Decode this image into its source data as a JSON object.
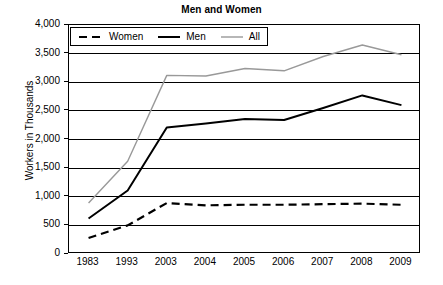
{
  "chart_data": {
    "type": "line",
    "title": "Men and Women",
    "xlabel": "",
    "ylabel": "Workers in Thousands",
    "categories": [
      "1983",
      "1993",
      "2003",
      "2004",
      "2005",
      "2006",
      "2007",
      "2008",
      "2009"
    ],
    "ylim": [
      0,
      4000
    ],
    "ytick_labels": [
      "4,000",
      "3,500",
      "3,000",
      "2,500",
      "2,000",
      "1,500",
      "1,000",
      "500",
      "0"
    ],
    "ytick_values": [
      4000,
      3500,
      3000,
      2500,
      2000,
      1500,
      1000,
      500,
      0
    ],
    "grid": true,
    "legend_position": "top-left",
    "series": [
      {
        "name": "Women",
        "style": "dashed",
        "color": "#000000",
        "values": [
          280,
          500,
          890,
          850,
          860,
          860,
          870,
          880,
          860
        ]
      },
      {
        "name": "Men",
        "style": "solid",
        "color": "#000000",
        "values": [
          620,
          1110,
          2210,
          2280,
          2360,
          2340,
          2550,
          2770,
          2600
        ]
      },
      {
        "name": "All",
        "style": "solid",
        "color": "#999999",
        "values": [
          890,
          1620,
          3120,
          3110,
          3240,
          3200,
          3450,
          3650,
          3480
        ]
      }
    ]
  },
  "legend": {
    "entries": [
      {
        "label": "Women",
        "icon": "dashed-line-icon"
      },
      {
        "label": "Men",
        "icon": "solid-line-icon"
      },
      {
        "label": "All",
        "icon": "solid-gray-line-icon"
      }
    ]
  }
}
